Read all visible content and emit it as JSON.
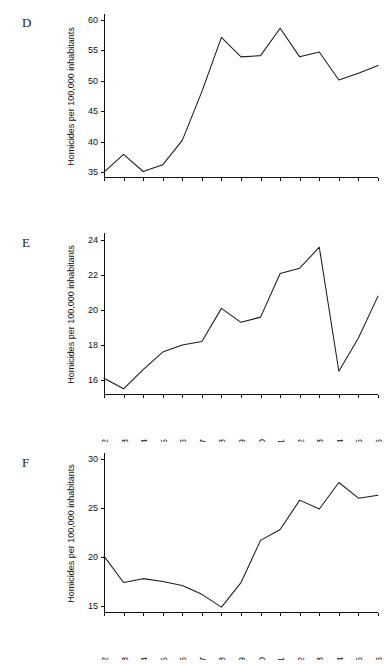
{
  "figure": {
    "panels": [
      {
        "letter": "D",
        "ylabel": "Homicides per 100,000 inhabitants",
        "yticks": [
          35,
          40,
          45,
          50,
          55,
          60
        ],
        "ylim": [
          34.2,
          60.6
        ],
        "values": [
          35.0,
          37.9,
          35.1,
          36.2,
          40.2,
          48.2,
          57.1,
          53.9,
          54.1,
          58.6,
          53.9,
          54.7,
          50.1,
          51.2,
          52.5
        ]
      },
      {
        "letter": "E",
        "ylabel": "Homicides per 100,000 inhabitants",
        "yticks": [
          16,
          18,
          20,
          22,
          24
        ],
        "ylim": [
          15.2,
          24.3
        ],
        "values": [
          16.1,
          15.5,
          16.6,
          17.6,
          18.0,
          18.2,
          20.1,
          19.3,
          19.6,
          22.1,
          22.4,
          23.6,
          16.5,
          18.4,
          20.8
        ]
      },
      {
        "letter": "F",
        "ylabel": "Homicides per 100,000 inhabitants",
        "yticks": [
          15,
          20,
          25,
          30
        ],
        "ylim": [
          14.4,
          30.4
        ],
        "values": [
          20.1,
          17.4,
          17.8,
          17.5,
          17.1,
          16.2,
          14.9,
          17.4,
          21.7,
          22.8,
          25.8,
          24.9,
          27.6,
          26.0,
          26.3
        ]
      }
    ],
    "xticks": [
      "1992",
      "1993",
      "1994",
      "1995",
      "1996",
      "1997",
      "1998",
      "1999",
      "2000",
      "2001",
      "2002",
      "2003",
      "2004",
      "2005",
      "2006"
    ],
    "caption": ""
  },
  "chart_data": [
    {
      "type": "line",
      "title": "D",
      "xlabel": "",
      "ylabel": "Homicides per 100,000 inhabitants",
      "x": [
        "1992",
        "1993",
        "1994",
        "1995",
        "1996",
        "1997",
        "1998",
        "1999",
        "2000",
        "2001",
        "2002",
        "2003",
        "2004",
        "2005",
        "2006"
      ],
      "values": [
        35.0,
        37.9,
        35.1,
        36.2,
        40.2,
        48.2,
        57.1,
        53.9,
        54.1,
        58.6,
        53.9,
        54.7,
        50.1,
        51.2,
        52.5
      ],
      "yticks": [
        35,
        40,
        45,
        50,
        55,
        60
      ],
      "ylim": [
        34.2,
        60.6
      ],
      "grid": false,
      "legend": "none"
    },
    {
      "type": "line",
      "title": "E",
      "xlabel": "",
      "ylabel": "Homicides per 100,000 inhabitants",
      "x": [
        "1992",
        "1993",
        "1994",
        "1995",
        "1996",
        "1997",
        "1998",
        "1999",
        "2000",
        "2001",
        "2002",
        "2003",
        "2004",
        "2005",
        "2006"
      ],
      "values": [
        16.1,
        15.5,
        16.6,
        17.6,
        18.0,
        18.2,
        20.1,
        19.3,
        19.6,
        22.1,
        22.4,
        23.6,
        16.5,
        18.4,
        20.8
      ],
      "yticks": [
        16,
        18,
        20,
        22,
        24
      ],
      "ylim": [
        15.2,
        24.3
      ],
      "grid": false,
      "legend": "none"
    },
    {
      "type": "line",
      "title": "F",
      "xlabel": "",
      "ylabel": "Homicides per 100,000 inhabitants",
      "x": [
        "1992",
        "1993",
        "1994",
        "1995",
        "1996",
        "1997",
        "1998",
        "1999",
        "2000",
        "2001",
        "2002",
        "2003",
        "2004",
        "2005",
        "2006"
      ],
      "values": [
        20.1,
        17.4,
        17.8,
        17.5,
        17.1,
        16.2,
        14.9,
        17.4,
        21.7,
        22.8,
        25.8,
        24.9,
        27.6,
        26.0,
        26.3
      ],
      "yticks": [
        15,
        20,
        25,
        30
      ],
      "ylim": [
        14.4,
        30.4
      ],
      "grid": false,
      "legend": "none"
    }
  ]
}
